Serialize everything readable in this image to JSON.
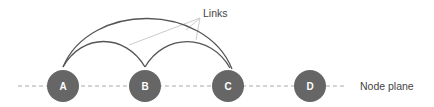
{
  "diagram": {
    "links_label": "Links",
    "plane_label": "Node plane",
    "nodes": [
      {
        "id": "A",
        "label": "A"
      },
      {
        "id": "B",
        "label": "B"
      },
      {
        "id": "C",
        "label": "C"
      },
      {
        "id": "D",
        "label": "D"
      }
    ],
    "links": [
      {
        "from": "A",
        "to": "B"
      },
      {
        "from": "B",
        "to": "C"
      },
      {
        "from": "A",
        "to": "C"
      }
    ],
    "colors": {
      "node_fill": "#666666",
      "node_text": "#ffffff",
      "arc": "#555555",
      "pointer": "#cccccc",
      "plane_dash": "#aaaaaa",
      "text": "#444444"
    }
  }
}
